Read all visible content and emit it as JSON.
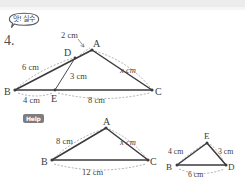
{
  "page": {
    "background_color": "#ffffff",
    "ink_color": "#3b3b3f"
  },
  "bubble": {
    "text": "앗! 실수",
    "icon": "speech-bubble"
  },
  "problem": {
    "number": "4."
  },
  "help": {
    "label": "Help",
    "badge_color": "#7d7d80"
  },
  "figures": {
    "main": {
      "name": "triangle-abc-with-cevian",
      "vertex_labels": {
        "A": "A",
        "B": "B",
        "C": "C",
        "D": "D",
        "E": "E"
      },
      "measures": {
        "DA": "2 cm",
        "BD": "6 cm",
        "AC": "x cm",
        "DE": "3 cm",
        "BE": "4 cm",
        "EC": "8 cm"
      }
    },
    "help_left": {
      "name": "triangle-abc",
      "vertex_labels": {
        "A": "A",
        "B": "B",
        "C": "C"
      },
      "measures": {
        "AB": "8 cm",
        "AC": "x cm",
        "BC": "12 cm"
      }
    },
    "help_right": {
      "name": "triangle-bed",
      "vertex_labels": {
        "E": "E",
        "B": "B",
        "D": "D"
      },
      "measures": {
        "BE": "4 cm",
        "ED": "3 cm",
        "BD": "6 cm"
      }
    }
  }
}
